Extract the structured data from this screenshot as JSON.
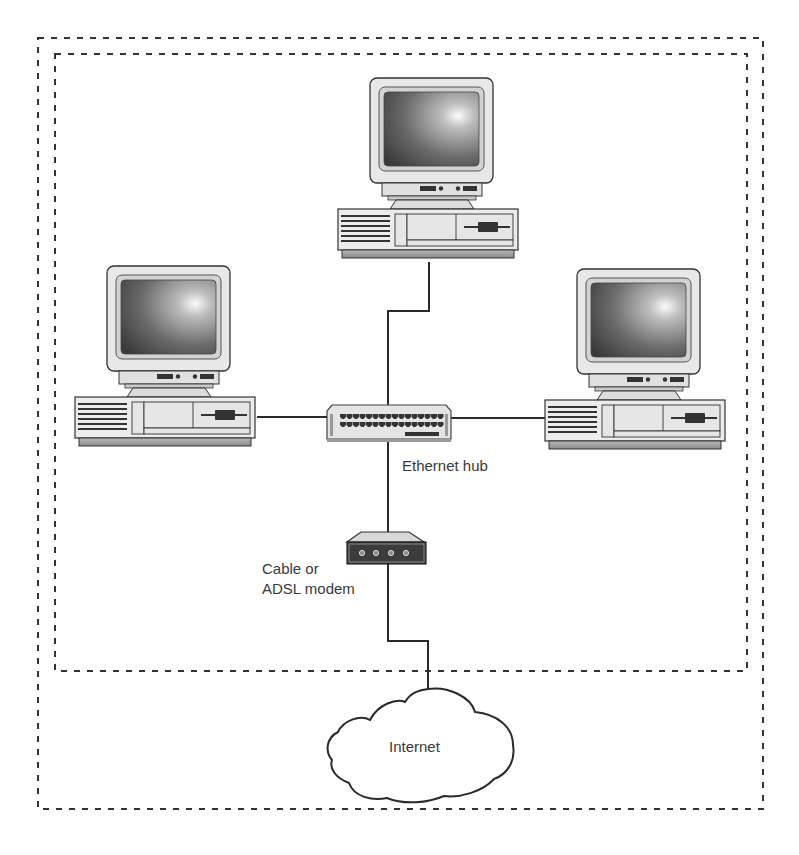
{
  "diagram": {
    "type": "home network topology",
    "labels": {
      "hub": "Ethernet hub",
      "modem_line1": "Cable or",
      "modem_line2": "ADSL modem",
      "internet": "Internet"
    },
    "nodes": [
      {
        "id": "pc-top",
        "kind": "desktop computer"
      },
      {
        "id": "pc-left",
        "kind": "desktop computer"
      },
      {
        "id": "pc-right",
        "kind": "desktop computer"
      },
      {
        "id": "hub",
        "kind": "Ethernet hub",
        "ports_per_row": 16,
        "rows": 2
      },
      {
        "id": "modem",
        "kind": "Cable or ADSL modem",
        "ports": 4
      },
      {
        "id": "internet",
        "kind": "cloud"
      }
    ],
    "edges": [
      [
        "pc-top",
        "hub"
      ],
      [
        "pc-left",
        "hub"
      ],
      [
        "pc-right",
        "hub"
      ],
      [
        "hub",
        "modem"
      ],
      [
        "modem",
        "internet"
      ]
    ],
    "boundaries": [
      "outer dashed boundary",
      "inner dashed boundary (local network)"
    ],
    "colors": {
      "line": "#2a2a2a",
      "casing": "#e6e6e6",
      "casing_shadow": "#9a9a9a",
      "screen_dark": "#3c3c3c",
      "screen_light": "#f4f4f4",
      "label": "#3a3a3a"
    }
  }
}
